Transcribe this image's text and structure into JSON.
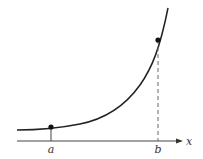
{
  "diagram": {
    "type": "exponential-curve",
    "axis": {
      "label": "x"
    },
    "points": [
      {
        "label": "a",
        "x": 51,
        "y": 127
      },
      {
        "label": "b",
        "x": 158,
        "y": 40
      }
    ],
    "colors": {
      "stroke": "#222222",
      "dashed": "#666666",
      "background": "#ffffff"
    }
  }
}
